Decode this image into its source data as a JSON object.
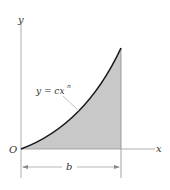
{
  "diagram": {
    "axes": {
      "x_label": "x",
      "y_label": "y",
      "origin_label": "O"
    },
    "curve": {
      "equation_label_main": "y = cx",
      "equation_label_exp": "n"
    },
    "dimension": {
      "label": "b"
    },
    "colors": {
      "fill": "#c8c8c8",
      "curve": "#1a1a1a",
      "axis": "#9a9a9a",
      "text": "#333333"
    }
  }
}
